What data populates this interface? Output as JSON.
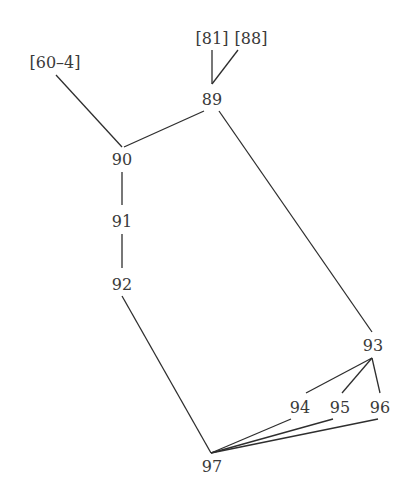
{
  "diagram": {
    "type": "stemma",
    "nodes": [
      {
        "id": "60-4",
        "label": "[60–4]"
      },
      {
        "id": "81",
        "label": "[81]"
      },
      {
        "id": "88",
        "label": "[88]"
      },
      {
        "id": "89",
        "label": "89"
      },
      {
        "id": "90",
        "label": "90"
      },
      {
        "id": "91",
        "label": "91"
      },
      {
        "id": "92",
        "label": "92"
      },
      {
        "id": "93",
        "label": "93"
      },
      {
        "id": "94",
        "label": "94"
      },
      {
        "id": "95",
        "label": "95"
      },
      {
        "id": "96",
        "label": "96"
      },
      {
        "id": "97",
        "label": "97"
      }
    ],
    "edges": [
      {
        "from": "81",
        "to": "89"
      },
      {
        "from": "88",
        "to": "89"
      },
      {
        "from": "60-4",
        "to": "90"
      },
      {
        "from": "89",
        "to": "90"
      },
      {
        "from": "89",
        "to": "93"
      },
      {
        "from": "90",
        "to": "91"
      },
      {
        "from": "91",
        "to": "92"
      },
      {
        "from": "92",
        "to": "97"
      },
      {
        "from": "93",
        "to": "94"
      },
      {
        "from": "93",
        "to": "95"
      },
      {
        "from": "93",
        "to": "96"
      },
      {
        "from": "94",
        "to": "97"
      },
      {
        "from": "95",
        "to": "97"
      },
      {
        "from": "96",
        "to": "97"
      }
    ]
  }
}
